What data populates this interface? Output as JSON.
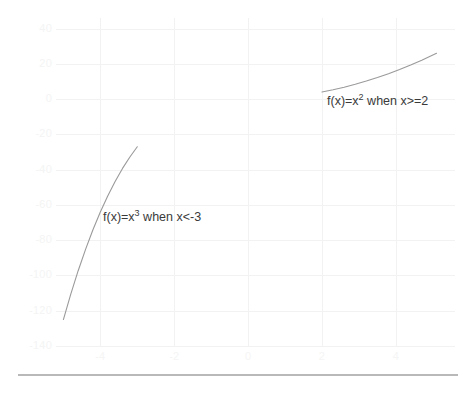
{
  "chart_data": {
    "type": "line",
    "title": "",
    "xlabel": "",
    "ylabel": "",
    "xlim": [
      -5.2,
      5.6
    ],
    "ylim": [
      -140,
      46
    ],
    "grid": true,
    "legend_position": "none",
    "x_ticks": [
      -4,
      -2,
      0,
      2,
      4
    ],
    "x_tick_labels": [
      "-4",
      "-2",
      "0",
      "2",
      "4"
    ],
    "y_ticks": [
      40,
      20,
      0,
      -20,
      -40,
      -60,
      -80,
      -100,
      -120,
      -140
    ],
    "y_tick_labels": [
      "40",
      "20",
      "0",
      "-20",
      "-40",
      "-60",
      "-80",
      "-100",
      "-120",
      "-140"
    ],
    "line_color": "#9a9a9a",
    "series": [
      {
        "name": "f(x)=x^3 when x<-3",
        "label": "f(x)=x",
        "exponent": "3",
        "condition": " when x<-3",
        "domain": [
          -5.0,
          -3.0
        ],
        "points": [
          {
            "x": -5.0,
            "y": -125
          },
          {
            "x": -4.8,
            "y": -110.6
          },
          {
            "x": -4.6,
            "y": -97.3
          },
          {
            "x": -4.4,
            "y": -85.2
          },
          {
            "x": -4.2,
            "y": -74.1
          },
          {
            "x": -4.0,
            "y": -64
          },
          {
            "x": -3.8,
            "y": -54.9
          },
          {
            "x": -3.6,
            "y": -46.7
          },
          {
            "x": -3.4,
            "y": -39.3
          },
          {
            "x": -3.2,
            "y": -32.8
          },
          {
            "x": -3.0,
            "y": -27
          }
        ]
      },
      {
        "name": "f(x)=x^2 when x>=2",
        "label": "f(x)=x",
        "exponent": "2",
        "condition": " when x>=2",
        "domain": [
          2.0,
          5.1
        ],
        "points": [
          {
            "x": 2.0,
            "y": 4
          },
          {
            "x": 2.3,
            "y": 5.29
          },
          {
            "x": 2.6,
            "y": 6.76
          },
          {
            "x": 2.9,
            "y": 8.41
          },
          {
            "x": 3.2,
            "y": 10.24
          },
          {
            "x": 3.5,
            "y": 12.25
          },
          {
            "x": 3.8,
            "y": 14.44
          },
          {
            "x": 4.1,
            "y": 16.81
          },
          {
            "x": 4.4,
            "y": 19.36
          },
          {
            "x": 4.7,
            "y": 22.09
          },
          {
            "x": 5.1,
            "y": 26.01
          }
        ]
      }
    ],
    "annotations": [
      {
        "id": "cubic",
        "text_prefix": "f(x)=x",
        "superscript": "3",
        "text_suffix": " when x<-3",
        "x_px": 103,
        "y_px": 211
      },
      {
        "id": "quadratic",
        "text_prefix": "f(x)=x",
        "superscript": "2",
        "text_suffix": " when x>=2",
        "x_px": 327,
        "y_px": 95
      }
    ]
  }
}
